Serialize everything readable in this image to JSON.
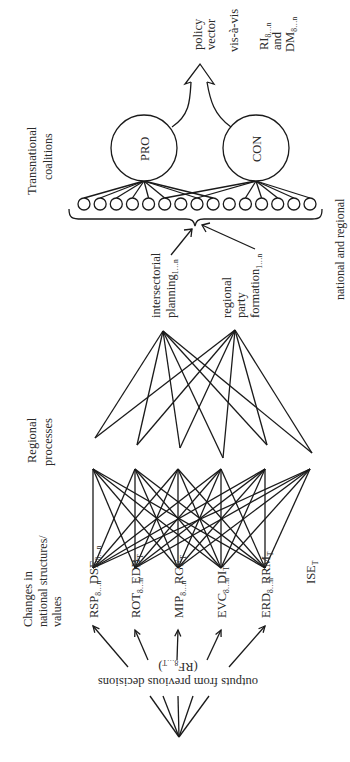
{
  "title_top": {
    "line1": "policy",
    "line2": "vector",
    "line3": "vis-à-vis",
    "line4_main": "RI",
    "line4_sub": "8…n",
    "line5": "and",
    "line6_main": "DM",
    "line6_sub": "8…n"
  },
  "coalitions": {
    "heading_line1": "Transnational",
    "heading_line2": "coalitions",
    "pro_label": "PRO",
    "con_label": "CON",
    "small_node_count": 15,
    "brace_label": "national and regional"
  },
  "mid_sources": [
    {
      "lines": [
        "intersectorial"
      ],
      "last_main": "planning",
      "last_sub": "1…n"
    },
    {
      "lines": [
        "regional",
        "party"
      ],
      "last_main": "formation",
      "last_sub": "1…n"
    }
  ],
  "regional_processes": {
    "heading_line1": "Regional",
    "heading_line2": "processes",
    "nodes": [
      {
        "main": "DSE",
        "sub": "8…n"
      },
      {
        "main": "EDB",
        "sub": "T"
      },
      {
        "main": "RGF",
        "sub": "T"
      },
      {
        "main": "DI",
        "sub": "T"
      },
      {
        "main": "RRM",
        "sub": "T"
      },
      {
        "main": "ISE",
        "sub": "T"
      }
    ]
  },
  "national_changes": {
    "heading_line1": "Changes in",
    "heading_line2": "national structures/",
    "heading_line3": "values",
    "nodes": [
      {
        "main": "RSP",
        "sub": "8…n"
      },
      {
        "main": "ROT",
        "sub": "8…n"
      },
      {
        "main": "MIP",
        "sub": "8…n"
      },
      {
        "main": "EVC",
        "sub": "8…n"
      },
      {
        "main": "ERD",
        "sub": "8…n"
      }
    ]
  },
  "outputs": {
    "line1": "outputs from previous decisions",
    "line2_main": "(RF",
    "line2_sub": "8…T",
    "line2_end": ")"
  }
}
